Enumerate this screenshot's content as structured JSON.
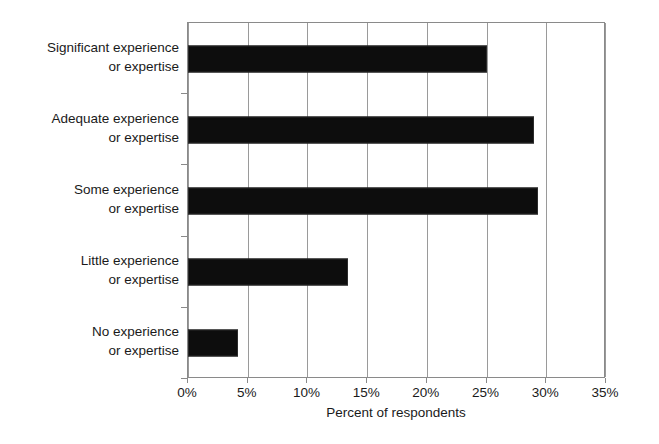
{
  "chart_data": {
    "type": "bar",
    "orientation": "horizontal",
    "title": "",
    "subtitle": "",
    "xlabel": "Percent of respondents",
    "ylabel": "",
    "categories": [
      "Significant experience or expertise",
      "Adequate experience or expertise",
      "Some experience or expertise",
      "Little experience or expertise",
      "No experience or expertise"
    ],
    "category_lines": [
      [
        "Significant experience",
        "or expertise"
      ],
      [
        "Adequate experience",
        "or expertise"
      ],
      [
        "Some experience",
        "or expertise"
      ],
      [
        "Little experience",
        "or expertise"
      ],
      [
        "No experience",
        "or expertise"
      ]
    ],
    "values": [
      25,
      29,
      29.3,
      13.4,
      4.2
    ],
    "value_labels": [
      "25%",
      "29%",
      "29%",
      "13%",
      "4%"
    ],
    "xlim": [
      0,
      35
    ],
    "xticks": [
      0,
      5,
      10,
      15,
      20,
      25,
      30,
      35
    ],
    "xtick_labels": [
      "0%",
      "5%",
      "10%",
      "15%",
      "20%",
      "25%",
      "30%",
      "35%"
    ],
    "grid": "vertical",
    "legend": "none",
    "bar_color": "#0d0d0d",
    "grid_color": "#9a9a9a",
    "axis_color": "#8a8a8a",
    "background_color": "#ffffff"
  }
}
